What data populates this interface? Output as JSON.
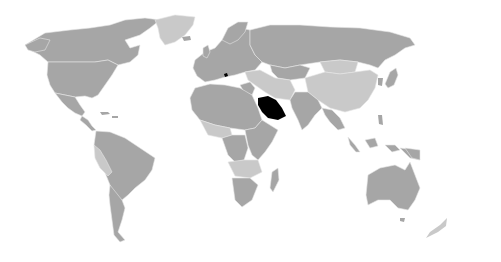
{
  "map": {
    "type": "world locator map",
    "projection": "equirectangular-like",
    "background_color": "#ffffff",
    "colors": {
      "highlight": "#000000",
      "medium_gray": "#a6a6a6",
      "light_gray": "#c9c9c9"
    },
    "highlighted_regions": [
      {
        "name": "Saudi Arabia",
        "color": "#000000"
      },
      {
        "name": "Small territory near Italy",
        "color": "#000000"
      }
    ],
    "light_gray_regions": [
      "Greenland",
      "China",
      "Mongolia",
      "Pakistan",
      "Iran",
      "Turkey",
      "parts of Africa",
      "Peru",
      "Bolivia",
      "parts of Central Asia"
    ],
    "medium_gray_regions": [
      "North America",
      "South America",
      "Europe",
      "Russia",
      "Africa",
      "India",
      "Southeast Asia",
      "Australia"
    ]
  }
}
